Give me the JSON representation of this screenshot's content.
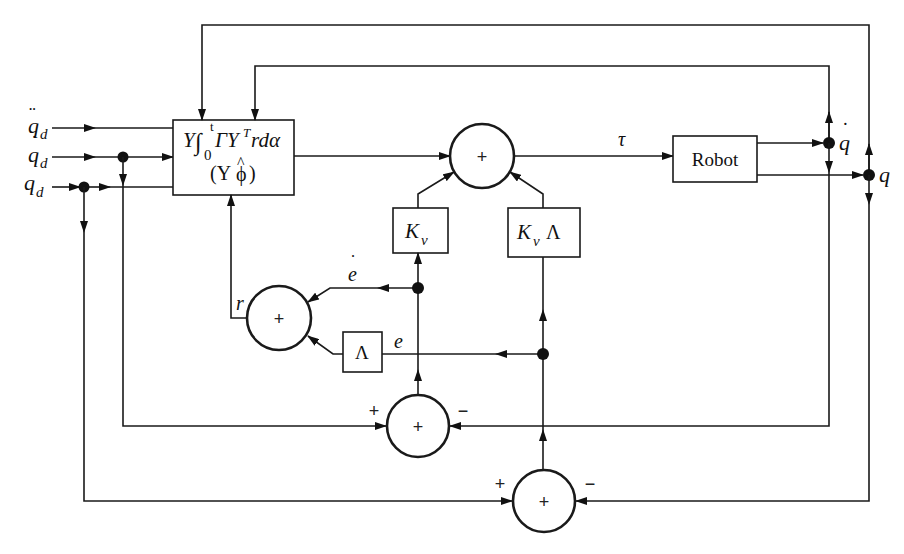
{
  "diagram": {
    "colors": {
      "line": "#1a1a1a",
      "background": "#ffffff"
    },
    "inputs": {
      "qdd": {
        "base": "q",
        "accent": "¨",
        "sub": "d"
      },
      "qd_dot": {
        "base": "q",
        "accent": "˙",
        "sub": "d"
      },
      "qd": {
        "base": "q",
        "sub": "d"
      }
    },
    "blocks": {
      "adaptive": {
        "line1_Y": "Y",
        "line1_int": "∫",
        "line1_lower": "0",
        "line1_upper": "t",
        "line1_rest": "ΓY",
        "line1_sup": "T",
        "line1_tail": "rdα",
        "line2": "(Y",
        "line2_phi": "ϕ",
        "line2_hat": "^",
        "line2_close": ")"
      },
      "robot": {
        "label": "Robot"
      },
      "kv": {
        "base": "K",
        "sub": "v"
      },
      "kv_lambda": {
        "base": "K",
        "sub": "v",
        "tail": "Λ"
      },
      "lambda": {
        "label": "Λ"
      }
    },
    "summers": {
      "main": {
        "sign": "+"
      },
      "r_sum": {
        "sign": "+"
      },
      "velocity_error": {
        "sign": "+",
        "in_plus": "+",
        "in_minus": "−"
      },
      "position_error": {
        "sign": "+",
        "in_plus": "+",
        "in_minus": "−"
      }
    },
    "signals": {
      "tau": "τ",
      "q_dot": {
        "base": "q",
        "accent": "˙"
      },
      "q": "q",
      "e_dot": {
        "base": "e",
        "accent": "˙"
      },
      "e": "e",
      "r": "r"
    }
  }
}
